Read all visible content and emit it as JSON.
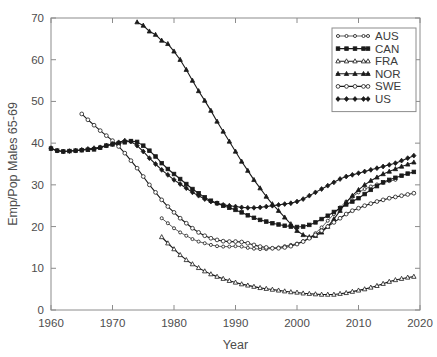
{
  "chart_data": {
    "type": "line",
    "title": "",
    "xlabel": "Year",
    "ylabel": "Emp/Pop Males 65-69",
    "xlim": [
      1960,
      2020
    ],
    "ylim": [
      0,
      70
    ],
    "xticks": [
      1960,
      1970,
      1980,
      1990,
      2000,
      2010,
      2020
    ],
    "yticks": [
      0,
      10,
      20,
      30,
      40,
      50,
      60,
      70
    ],
    "grid": false,
    "legend_position": "top-right",
    "series": [
      {
        "name": "AUS",
        "marker": "open-circle",
        "line": "thin",
        "x": [
          1978,
          1979,
          1980,
          1981,
          1982,
          1983,
          1984,
          1985,
          1986,
          1987,
          1988,
          1989,
          1990,
          1991,
          1992,
          1993,
          1994,
          1995,
          1996,
          1997,
          1998,
          1999,
          2000,
          2001,
          2002,
          2003,
          2004,
          2005,
          2006,
          2007,
          2008,
          2009,
          2010,
          2011,
          2012,
          2013,
          2014,
          2015,
          2016
        ],
        "y": [
          22.0,
          20.8,
          19.6,
          18.6,
          17.8,
          17.0,
          16.4,
          16.0,
          15.6,
          15.3,
          15.2,
          15.2,
          15.3,
          15.2,
          14.9,
          14.7,
          14.6,
          14.6,
          14.8,
          15.0,
          15.3,
          15.6,
          15.9,
          16.5,
          17.3,
          18.4,
          19.8,
          21.4,
          23.0,
          24.6,
          26.0,
          27.1,
          28.2,
          29.0,
          29.6,
          30.1,
          30.5,
          30.9,
          31.2
        ]
      },
      {
        "name": "CAN",
        "marker": "filled-square",
        "line": "normal",
        "x": [
          1960,
          1961,
          1962,
          1963,
          1964,
          1965,
          1966,
          1967,
          1968,
          1969,
          1970,
          1971,
          1972,
          1973,
          1974,
          1975,
          1976,
          1977,
          1978,
          1979,
          1980,
          1981,
          1982,
          1983,
          1984,
          1985,
          1986,
          1987,
          1988,
          1989,
          1990,
          1991,
          1992,
          1993,
          1994,
          1995,
          1996,
          1997,
          1998,
          1999,
          2000,
          2001,
          2002,
          2003,
          2004,
          2005,
          2006,
          2007,
          2008,
          2009,
          2010,
          2011,
          2012,
          2013,
          2014,
          2015,
          2016,
          2017,
          2018,
          2019
        ],
        "y": [
          38.7,
          38.2,
          38.0,
          38.1,
          38.2,
          38.3,
          38.4,
          38.5,
          38.9,
          39.4,
          39.7,
          39.9,
          40.2,
          40.5,
          40.3,
          39.4,
          38.2,
          36.8,
          35.2,
          33.8,
          32.6,
          31.4,
          30.2,
          29.0,
          28.0,
          27.0,
          26.2,
          25.6,
          25.0,
          24.5,
          24.0,
          23.4,
          22.7,
          22.1,
          21.6,
          21.2,
          20.8,
          20.5,
          20.2,
          20.0,
          19.9,
          20.0,
          20.4,
          21.0,
          21.8,
          22.6,
          23.5,
          24.4,
          25.3,
          26.0,
          26.8,
          27.8,
          28.8,
          29.7,
          30.6,
          31.2,
          31.7,
          32.2,
          32.7,
          33.1
        ]
      },
      {
        "name": "FRA",
        "marker": "open-triangle",
        "line": "normal",
        "x": [
          1978,
          1979,
          1980,
          1981,
          1982,
          1983,
          1984,
          1985,
          1986,
          1987,
          1988,
          1989,
          1990,
          1991,
          1992,
          1993,
          1994,
          1995,
          1996,
          1997,
          1998,
          1999,
          2000,
          2001,
          2002,
          2003,
          2004,
          2005,
          2006,
          2007,
          2008,
          2009,
          2010,
          2011,
          2012,
          2013,
          2014,
          2015,
          2016,
          2017,
          2018,
          2019
        ],
        "y": [
          17.5,
          16.0,
          14.6,
          13.2,
          12.0,
          11.0,
          10.1,
          9.3,
          8.6,
          8.0,
          7.5,
          7.0,
          6.6,
          6.2,
          5.9,
          5.6,
          5.3,
          5.1,
          4.9,
          4.7,
          4.5,
          4.3,
          4.2,
          4.0,
          3.9,
          3.8,
          3.7,
          3.7,
          3.7,
          3.9,
          4.1,
          4.4,
          4.7,
          5.0,
          5.4,
          5.8,
          6.3,
          6.8,
          7.2,
          7.5,
          7.8,
          8.0
        ]
      },
      {
        "name": "NOR",
        "marker": "filled-triangle",
        "line": "normal",
        "x": [
          1974,
          1975,
          1976,
          1977,
          1978,
          1979,
          1980,
          1981,
          1982,
          1983,
          1984,
          1985,
          1986,
          1987,
          1988,
          1989,
          1990,
          1991,
          1992,
          1993,
          1994,
          1995,
          1996,
          1997,
          1998,
          1999,
          2000,
          2001,
          2002,
          2003,
          2004,
          2005,
          2006,
          2007,
          2008,
          2009,
          2010,
          2011,
          2012,
          2013,
          2014,
          2015,
          2016,
          2017,
          2018,
          2019
        ],
        "y": [
          69.0,
          68.2,
          66.8,
          66.0,
          64.6,
          63.8,
          62.0,
          60.0,
          57.6,
          55.0,
          52.5,
          50.2,
          47.8,
          45.2,
          42.8,
          40.4,
          38.0,
          35.6,
          33.4,
          31.2,
          29.2,
          27.2,
          25.4,
          23.8,
          22.2,
          20.6,
          19.0,
          18.0,
          17.5,
          17.8,
          18.6,
          20.0,
          21.8,
          23.8,
          25.8,
          27.4,
          28.8,
          30.0,
          31.0,
          31.8,
          32.6,
          33.2,
          33.8,
          34.4,
          34.9,
          35.4
        ]
      },
      {
        "name": "SWE",
        "marker": "open-circle",
        "line": "normal",
        "x": [
          1965,
          1966,
          1967,
          1968,
          1969,
          1970,
          1971,
          1972,
          1973,
          1974,
          1975,
          1976,
          1977,
          1978,
          1979,
          1980,
          1981,
          1982,
          1983,
          1984,
          1985,
          1986,
          1987,
          1988,
          1989,
          1990,
          1991,
          1992,
          1993,
          1994,
          1995,
          1996,
          1997,
          1998,
          1999,
          2000,
          2001,
          2002,
          2003,
          2004,
          2005,
          2006,
          2007,
          2008,
          2009,
          2010,
          2011,
          2012,
          2013,
          2014,
          2015,
          2016,
          2017,
          2018,
          2019
        ],
        "y": [
          47.0,
          45.6,
          44.3,
          43.0,
          41.8,
          40.6,
          39.2,
          37.6,
          35.8,
          34.0,
          32.0,
          30.0,
          28.2,
          26.4,
          24.8,
          23.4,
          22.0,
          20.8,
          19.6,
          18.6,
          17.8,
          17.2,
          16.8,
          16.5,
          16.4,
          16.4,
          16.3,
          16.0,
          15.6,
          15.2,
          15.0,
          14.8,
          14.8,
          15.0,
          15.3,
          15.8,
          16.4,
          17.2,
          18.0,
          19.0,
          20.0,
          21.0,
          22.0,
          23.0,
          23.8,
          24.4,
          25.0,
          25.5,
          26.0,
          26.4,
          26.8,
          27.1,
          27.4,
          27.7,
          28.0
        ]
      },
      {
        "name": "US",
        "marker": "filled-diamond",
        "line": "normal",
        "x": [
          1960,
          1961,
          1962,
          1963,
          1964,
          1965,
          1966,
          1967,
          1968,
          1969,
          1970,
          1971,
          1972,
          1973,
          1974,
          1975,
          1976,
          1977,
          1978,
          1979,
          1980,
          1981,
          1982,
          1983,
          1984,
          1985,
          1986,
          1987,
          1988,
          1989,
          1990,
          1991,
          1992,
          1993,
          1994,
          1995,
          1996,
          1997,
          1998,
          1999,
          2000,
          2001,
          2002,
          2003,
          2004,
          2005,
          2006,
          2007,
          2008,
          2009,
          2010,
          2011,
          2012,
          2013,
          2014,
          2015,
          2016,
          2017,
          2018,
          2019
        ],
        "y": [
          38.8,
          38.2,
          38.0,
          38.1,
          38.2,
          38.4,
          38.6,
          38.8,
          39.0,
          39.4,
          39.8,
          40.2,
          40.6,
          40.4,
          39.4,
          38.0,
          36.4,
          35.0,
          33.6,
          32.4,
          31.2,
          30.2,
          29.2,
          28.2,
          27.4,
          26.6,
          26.0,
          25.6,
          25.2,
          25.0,
          24.8,
          24.6,
          24.5,
          24.5,
          24.6,
          24.8,
          25.0,
          25.2,
          25.4,
          25.6,
          26.0,
          26.6,
          27.4,
          28.2,
          29.0,
          29.8,
          30.6,
          31.4,
          32.0,
          32.4,
          32.8,
          33.2,
          33.6,
          34.0,
          34.4,
          34.8,
          35.2,
          35.8,
          36.4,
          37.0
        ]
      }
    ]
  },
  "legend": {
    "items": [
      {
        "label": "AUS"
      },
      {
        "label": "CAN"
      },
      {
        "label": "FRA"
      },
      {
        "label": "NOR"
      },
      {
        "label": "SWE"
      },
      {
        "label": "US"
      }
    ]
  },
  "axes": {
    "x_tick_labels": [
      "1960",
      "1970",
      "1980",
      "1990",
      "2000",
      "2010",
      "2020"
    ],
    "y_tick_labels": [
      "0",
      "10",
      "20",
      "30",
      "40",
      "50",
      "60",
      "70"
    ],
    "x_axis_title": "Year",
    "y_axis_title": "Emp/Pop Males 65-69"
  },
  "colors": {
    "line": "#1a1a1a",
    "axis": "#8c8c8c",
    "text": "#4d4d4d",
    "background": "#ffffff"
  }
}
